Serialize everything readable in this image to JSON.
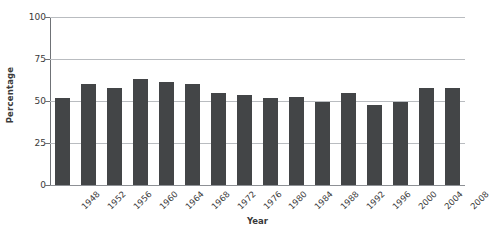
{
  "chart_data": {
    "type": "bar",
    "title": "",
    "xlabel": "Year",
    "ylabel": "Percentage",
    "categories": [
      "1948",
      "1952",
      "1956",
      "1960",
      "1964",
      "1968",
      "1972",
      "1976",
      "1980",
      "1984",
      "1988",
      "1992",
      "1996",
      "2000",
      "2004",
      "2008"
    ],
    "values": [
      51.5,
      60.0,
      58.0,
      63.0,
      61.5,
      60.0,
      55.0,
      53.5,
      52.0,
      52.5,
      49.5,
      55.0,
      47.5,
      49.5,
      58.0,
      58.0
    ],
    "ylim": [
      0,
      100
    ],
    "yticks": [
      0,
      25,
      50,
      75,
      100
    ],
    "ytick_labels": [
      "0",
      "25",
      "50",
      "75",
      "100"
    ],
    "xlim_categories": 16,
    "grid": true,
    "grid_axis": "y",
    "legend": null,
    "legend_position": "none",
    "bar_color": "#434547",
    "grid_color": "#b9bcc0",
    "axis_color": "#6f7276",
    "background_color": "#ffffff",
    "series": [
      {
        "name": "Percentage",
        "values": [
          51.5,
          60.0,
          58.0,
          63.0,
          61.5,
          60.0,
          55.0,
          53.5,
          52.0,
          52.5,
          49.5,
          55.0,
          47.5,
          49.5,
          58.0,
          58.0
        ]
      }
    ]
  }
}
